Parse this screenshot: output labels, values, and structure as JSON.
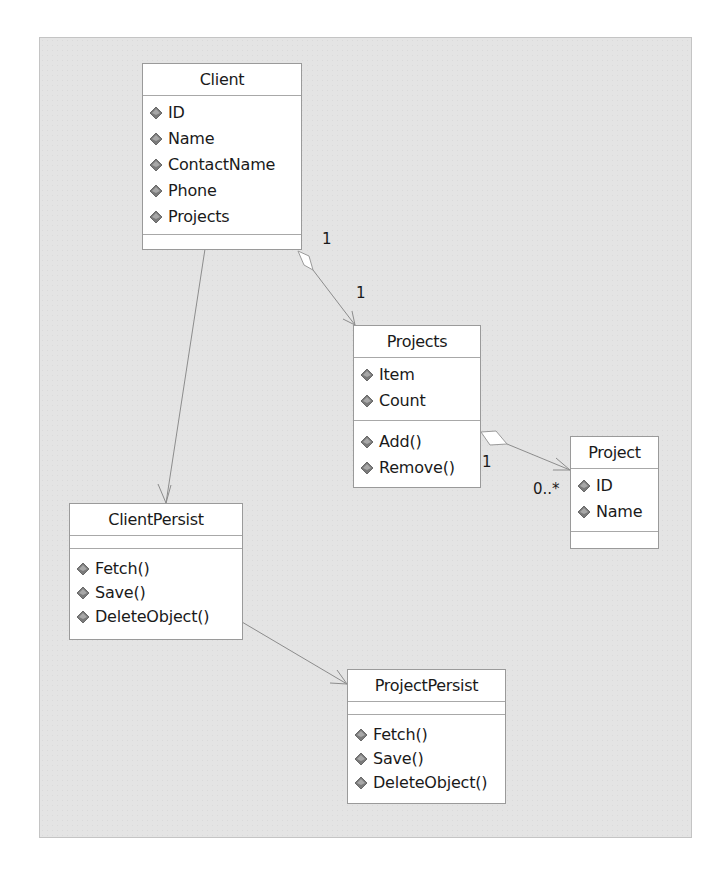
{
  "diagram": {
    "type": "UML class diagram",
    "classes": [
      {
        "id": "client",
        "name": "Client",
        "attributes": [
          "ID",
          "Name",
          "ContactName",
          "Phone",
          "Projects"
        ],
        "operations": []
      },
      {
        "id": "projects",
        "name": "Projects",
        "attributes": [
          "Item",
          "Count"
        ],
        "operations": [
          "Add()",
          "Remove()"
        ]
      },
      {
        "id": "project",
        "name": "Project",
        "attributes": [
          "ID",
          "Name"
        ],
        "operations": []
      },
      {
        "id": "clientpersist",
        "name": "ClientPersist",
        "attributes": [],
        "operations": [
          "Fetch()",
          "Save()",
          "DeleteObject()"
        ]
      },
      {
        "id": "projectpersist",
        "name": "ProjectPersist",
        "attributes": [],
        "operations": [
          "Fetch()",
          "Save()",
          "DeleteObject()"
        ]
      }
    ],
    "relationships": [
      {
        "from": "Client",
        "to": "Projects",
        "kind": "aggregation",
        "from_multiplicity": "1",
        "to_multiplicity": "1"
      },
      {
        "from": "Projects",
        "to": "Project",
        "kind": "aggregation",
        "from_multiplicity": "1",
        "to_multiplicity": "0..*"
      },
      {
        "from": "Client",
        "to": "ClientPersist",
        "kind": "association"
      },
      {
        "from": "ClientPersist",
        "to": "ProjectPersist",
        "kind": "association"
      }
    ],
    "colors": {
      "background": "#e4e4e4",
      "box": "#ffffff",
      "border": "#9a9a9a",
      "line": "#8c8c8c"
    }
  }
}
